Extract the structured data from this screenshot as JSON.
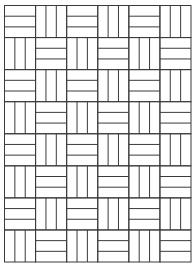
{
  "pattern": {
    "name": "basketweave",
    "columns": 6,
    "rows": 8,
    "stripes_per_cell": 3,
    "origin_x": 4.5,
    "origin_y": 5.5,
    "width": 186.5,
    "height": 256.5,
    "first_cell_orientation": "horizontal",
    "line_color": "#3a3a3a",
    "background": "#ffffff"
  }
}
